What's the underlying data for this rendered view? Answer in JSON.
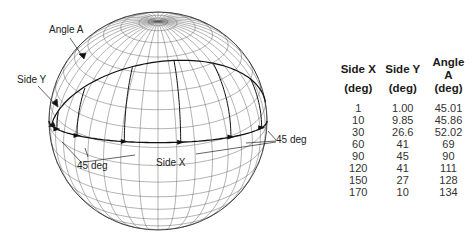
{
  "figure": {
    "labels": {
      "angle_a": "Angle A",
      "side_y": "Side Y",
      "side_x": "Side X",
      "deg45_left": "45 deg",
      "deg45_right": "45 deg"
    }
  },
  "table": {
    "headers": [
      {
        "line1": "Side X",
        "line2": "(deg)"
      },
      {
        "line1": "Side Y",
        "line2": "(deg)"
      },
      {
        "line1": "Angle A",
        "line2": "(deg)"
      }
    ],
    "rows": [
      [
        "1",
        "1.00",
        "45.01"
      ],
      [
        "10",
        "9.85",
        "45.86"
      ],
      [
        "30",
        "26.6",
        "52.02"
      ],
      [
        "60",
        "41",
        "69"
      ],
      [
        "90",
        "45",
        "90"
      ],
      [
        "120",
        "41",
        "111"
      ],
      [
        "150",
        "27",
        "128"
      ],
      [
        "170",
        "10",
        "134"
      ]
    ]
  },
  "chart_data": {
    "type": "table",
    "columns": [
      "Side X (deg)",
      "Side Y (deg)",
      "Angle A (deg)"
    ],
    "rows": [
      [
        1,
        1.0,
        45.01
      ],
      [
        10,
        9.85,
        45.86
      ],
      [
        30,
        26.6,
        52.02
      ],
      [
        60,
        41,
        69
      ],
      [
        90,
        45,
        90
      ],
      [
        120,
        41,
        111
      ],
      [
        150,
        27,
        128
      ],
      [
        170,
        10,
        134
      ]
    ],
    "annotations": [
      "Angle A",
      "Side Y",
      "Side X",
      "45 deg",
      "45 deg"
    ]
  }
}
